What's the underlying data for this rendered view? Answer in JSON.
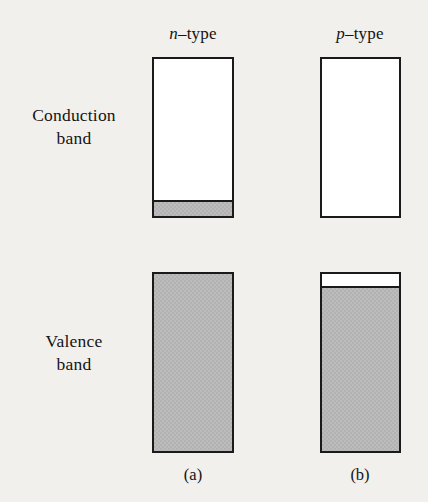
{
  "figure": {
    "type": "semiconductor-band-diagram",
    "background_color": "#f2f0ec",
    "line_color": "#1a1a1a",
    "fill_color": "#b2b2b2",
    "empty_color": "#ffffff"
  },
  "row_labels": {
    "conduction": {
      "line1": "Conduction",
      "line2": "band"
    },
    "valence": {
      "line1": "Valence",
      "line2": "band"
    }
  },
  "columns": [
    {
      "id": "n-type",
      "symbol": "n",
      "separator": "–",
      "word": "type",
      "caption": "(a)"
    },
    {
      "id": "p-type",
      "symbol": "p",
      "separator": "–",
      "word": "type",
      "caption": "(b)"
    }
  ],
  "chart_data": {
    "type": "bar",
    "title": "",
    "subtitle": "",
    "xlabel": "",
    "ylabel": "",
    "categories": [
      "n-type",
      "p-type"
    ],
    "series": [
      {
        "name": "Conduction band — occupied fraction",
        "values": [
          0.09,
          0.0
        ]
      },
      {
        "name": "Conduction band — empty fraction",
        "values": [
          0.91,
          1.0
        ]
      },
      {
        "name": "Valence band — occupied fraction",
        "values": [
          1.0,
          0.92
        ]
      },
      {
        "name": "Valence band — empty fraction",
        "values": [
          0.0,
          0.08
        ]
      }
    ],
    "annotations": [
      "n-type: conduction band has a thin layer of electrons at its bottom edge; valence band is completely full.",
      "p-type: conduction band is completely empty; valence band has a thin layer of holes at its top edge."
    ],
    "legend_position": "none",
    "grid": false
  },
  "bands": {
    "conduction_n": {
      "fill_position": "bottom",
      "fill_fraction": 0.09,
      "has_top_edge_line": true
    },
    "conduction_p": {
      "fill_position": "none",
      "fill_fraction": 0.0,
      "has_top_edge_line": false
    },
    "valence_n": {
      "fill_position": "full",
      "fill_fraction": 1.0,
      "has_top_edge_line": false
    },
    "valence_p": {
      "fill_position": "bottom",
      "fill_fraction": 0.92,
      "has_top_edge_line": true
    }
  }
}
